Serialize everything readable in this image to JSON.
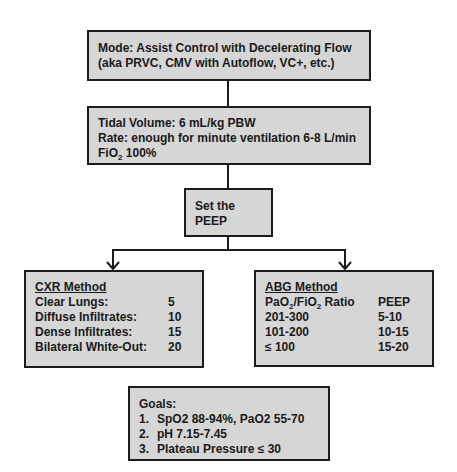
{
  "mode_box": {
    "line1": "Mode: Assist Control with Decelerating Flow",
    "line2": "(aka PRVC, CMV with Autoflow, VC+, etc.)"
  },
  "settings_box": {
    "tidal_volume": "Tidal Volume: 6 mL/kg PBW",
    "rate": "Rate: enough for minute ventilation 6-8 L/min",
    "fio2_prefix": "FiO",
    "fio2_sub": "2",
    "fio2_value": " 100%"
  },
  "peep_box": {
    "line1": "Set the",
    "line2": "PEEP"
  },
  "cxr_box": {
    "title": "CXR Method",
    "rows": [
      {
        "label": "Clear Lungs:",
        "value": "5"
      },
      {
        "label": "Diffuse Infiltrates:",
        "value": "10"
      },
      {
        "label": "Dense Infiltrates:",
        "value": "15"
      },
      {
        "label": "Bilateral White-Out:",
        "value": "20"
      }
    ]
  },
  "abg_box": {
    "title": "ABG Method",
    "header_label_a": "PaO",
    "header_sub_a": "2",
    "header_label_b": "/FiO",
    "header_sub_b": "2",
    "header_label_c": " Ratio",
    "header_value": "PEEP",
    "rows": [
      {
        "label": "201-300",
        "value": "5-10"
      },
      {
        "label": "101-200",
        "value": "10-15"
      },
      {
        "label": "≤ 100",
        "value": "15-20"
      }
    ]
  },
  "goals_box": {
    "title": "Goals:",
    "items": [
      {
        "num": "1.",
        "text": "SpO2 88-94%, PaO2 55-70"
      },
      {
        "num": "2.",
        "text": "pH 7.15-7.45"
      },
      {
        "num": "3.",
        "text": "Plateau Pressure ≤ 30"
      }
    ]
  },
  "colors": {
    "box_fill": "#d6d6d6",
    "border": "#1c1c1c",
    "background": "#ffffff"
  }
}
